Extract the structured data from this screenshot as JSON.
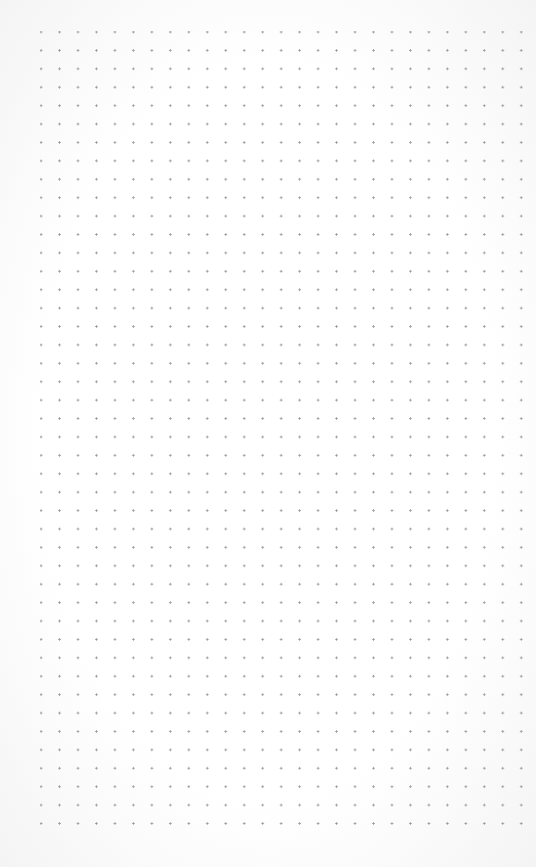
{
  "canvas": {
    "type": "dot-grid",
    "background_color": "#fdfdfd",
    "dot_color": "#9a9a9a",
    "columns": 27,
    "rows": 44,
    "spacing_px": 18.5
  }
}
